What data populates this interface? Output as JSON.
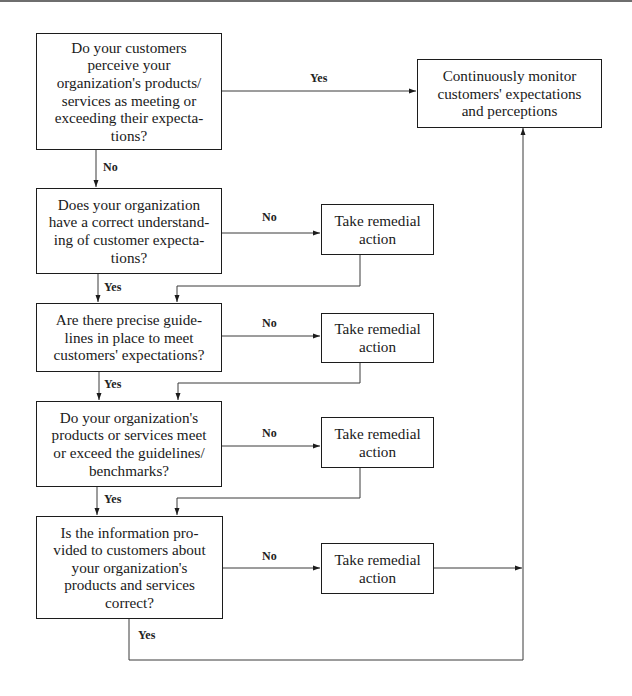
{
  "diagram": {
    "type": "flowchart",
    "decisions": [
      {
        "id": "q1",
        "text": "Do your customers\nperceive your\norganization's products/\nservices as meeting or\nexceeding their expecta-\ntions?"
      },
      {
        "id": "q2",
        "text": "Does your organization\nhave a correct understand-\ning of customer expecta-\ntions?"
      },
      {
        "id": "q3",
        "text": "Are there precise guide-\nlines in place to meet\ncustomers' expectations?"
      },
      {
        "id": "q4",
        "text": "Do your organization's\nproducts or services meet\nor exceed the guidelines/\nbenchmarks?"
      },
      {
        "id": "q5",
        "text": "Is the information pro-\nvided to customers about\nyour organization's\nproducts and services\ncorrect?"
      }
    ],
    "monitor": {
      "id": "monitor",
      "text": "Continuously monitor\ncustomers' expectations\nand perceptions"
    },
    "remedial": [
      {
        "id": "r1",
        "text": "Take remedial\naction"
      },
      {
        "id": "r2",
        "text": "Take remedial\naction"
      },
      {
        "id": "r3",
        "text": "Take remedial\naction"
      },
      {
        "id": "r4",
        "text": "Take remedial\naction"
      }
    ],
    "edge_labels": {
      "q1_yes": "Yes",
      "q1_no": "No",
      "q2_no": "No",
      "q2_yes": "Yes",
      "q3_no": "No",
      "q3_yes": "Yes",
      "q4_no": "No",
      "q4_yes": "Yes",
      "q5_no": "No",
      "q5_yes": "Yes"
    },
    "edges": [
      {
        "from": "q1",
        "to": "monitor",
        "label": "Yes"
      },
      {
        "from": "q1",
        "to": "q2",
        "label": "No"
      },
      {
        "from": "q2",
        "to": "r1",
        "label": "No"
      },
      {
        "from": "q2",
        "to": "q3",
        "label": "Yes"
      },
      {
        "from": "r1",
        "to": "q3"
      },
      {
        "from": "q3",
        "to": "r2",
        "label": "No"
      },
      {
        "from": "q3",
        "to": "q4",
        "label": "Yes"
      },
      {
        "from": "r2",
        "to": "q4"
      },
      {
        "from": "q4",
        "to": "r3",
        "label": "No"
      },
      {
        "from": "q4",
        "to": "q5",
        "label": "Yes"
      },
      {
        "from": "r3",
        "to": "q5"
      },
      {
        "from": "q5",
        "to": "r4",
        "label": "No"
      },
      {
        "from": "q5",
        "to": "monitor",
        "label": "Yes"
      },
      {
        "from": "r4",
        "to": "monitor"
      }
    ]
  }
}
